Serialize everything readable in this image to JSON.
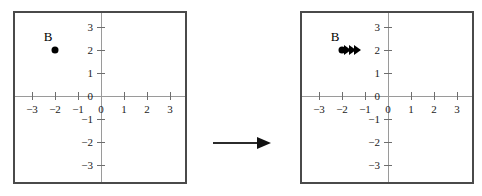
{
  "figure": {
    "title": "",
    "transition_arrow": "arrow-right"
  },
  "chart_data": {
    "type": "scatter",
    "title": "",
    "xlabel": "",
    "ylabel": "",
    "xlim": [
      -3.8,
      3.8
    ],
    "ylim": [
      -3.8,
      3.8
    ],
    "grid": false,
    "legend": null,
    "panels": [
      {
        "id": "before",
        "name": "before-translation",
        "xticks": [
          -3,
          -2,
          -1,
          0,
          1,
          2,
          3
        ],
        "xticklabels": [
          "-3",
          "-2",
          "-1",
          "0",
          "1",
          "2",
          "3"
        ],
        "yticks": [
          3,
          2,
          1,
          0,
          -1,
          -2,
          -3
        ],
        "yticklabels": [
          "3",
          "2",
          "1",
          "0",
          "-1",
          "-2",
          "-3"
        ],
        "points": [
          {
            "label": "B",
            "x": -2,
            "y": 2
          }
        ],
        "motion_chevrons": null
      },
      {
        "id": "after",
        "name": "after-translation",
        "xticks": [
          -3,
          -2,
          -1,
          0,
          1,
          2,
          3
        ],
        "xticklabels": [
          "-3",
          "-2",
          "-1",
          "0",
          "1",
          "2",
          "3"
        ],
        "yticks": [
          3,
          2,
          1,
          0,
          -1,
          -2,
          -3
        ],
        "yticklabels": [
          "3",
          "2",
          "1",
          "0",
          "-1",
          "-2",
          "-3"
        ],
        "points": [
          {
            "label": "B",
            "x": -2,
            "y": 2
          }
        ],
        "motion_chevrons": {
          "x": -2,
          "y": 2,
          "count": 3,
          "direction": "right"
        }
      }
    ]
  }
}
